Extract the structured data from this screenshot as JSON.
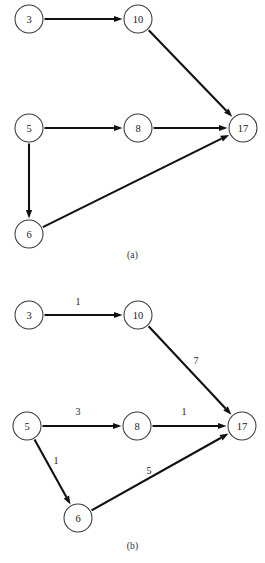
{
  "figure": {
    "background_color": "#ffffff",
    "node_stroke_color": "#3a3a3a",
    "edge_color": "#111111",
    "text_color": "#181818"
  },
  "chart_data": {
    "type": "diagram",
    "diagram_kind": "directed-graph",
    "panels": [
      {
        "id": "a",
        "caption": "(a)",
        "weighted": false,
        "nodes": [
          {
            "id": "n3",
            "label": "3",
            "cx": 29,
            "cy": 19,
            "r": 14
          },
          {
            "id": "n10",
            "label": "10",
            "cx": 138,
            "cy": 19,
            "r": 14
          },
          {
            "id": "n5",
            "label": "5",
            "cx": 29,
            "cy": 128,
            "r": 14
          },
          {
            "id": "n8",
            "label": "8",
            "cx": 138,
            "cy": 128,
            "r": 14
          },
          {
            "id": "n17",
            "label": "17",
            "cx": 243,
            "cy": 128,
            "r": 14
          },
          {
            "id": "n6",
            "label": "6",
            "cx": 29,
            "cy": 234,
            "r": 14
          }
        ],
        "edges": [
          {
            "from": "n3",
            "to": "n10",
            "weight": null
          },
          {
            "from": "n10",
            "to": "n17",
            "weight": null
          },
          {
            "from": "n5",
            "to": "n8",
            "weight": null
          },
          {
            "from": "n8",
            "to": "n17",
            "weight": null
          },
          {
            "from": "n5",
            "to": "n6",
            "weight": null
          },
          {
            "from": "n6",
            "to": "n17",
            "weight": null
          }
        ]
      },
      {
        "id": "b",
        "caption": "(b)",
        "weighted": true,
        "nodes": [
          {
            "id": "n3",
            "label": "3",
            "cx": 29,
            "cy": 35,
            "r": 14
          },
          {
            "id": "n10",
            "label": "10",
            "cx": 138,
            "cy": 35,
            "r": 14
          },
          {
            "id": "n5",
            "label": "5",
            "cx": 27,
            "cy": 146,
            "r": 14
          },
          {
            "id": "n8",
            "label": "8",
            "cx": 137,
            "cy": 146,
            "r": 14
          },
          {
            "id": "n17",
            "label": "17",
            "cx": 242,
            "cy": 146,
            "r": 14
          },
          {
            "id": "n6",
            "label": "6",
            "cx": 78,
            "cy": 238,
            "r": 14
          }
        ],
        "edges": [
          {
            "from": "n3",
            "to": "n10",
            "weight": "1",
            "lx": 78,
            "ly": 21
          },
          {
            "from": "n10",
            "to": "n17",
            "weight": "7",
            "lx": 196,
            "ly": 80
          },
          {
            "from": "n5",
            "to": "n8",
            "weight": "3",
            "lx": 78,
            "ly": 131
          },
          {
            "from": "n8",
            "to": "n17",
            "weight": "1",
            "lx": 184,
            "ly": 131
          },
          {
            "from": "n5",
            "to": "n6",
            "weight": "1",
            "lx": 56,
            "ly": 180
          },
          {
            "from": "n6",
            "to": "n17",
            "weight": "5",
            "lx": 149,
            "ly": 190
          }
        ]
      }
    ]
  }
}
